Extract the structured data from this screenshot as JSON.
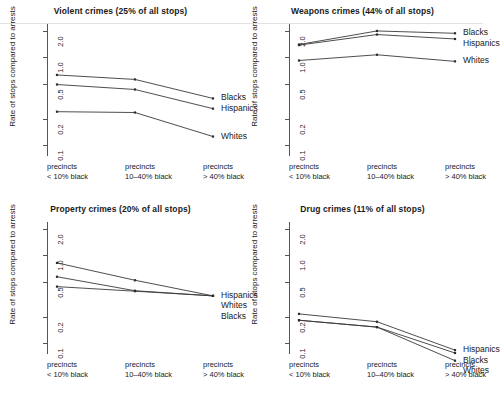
{
  "figure": {
    "ylabel": "Rate of stops compared to arrests",
    "y_ticks": [
      "0.1",
      "0.2",
      "0.5",
      "1.0",
      "2.0"
    ],
    "x_categories": [
      {
        "line1": "precincts",
        "line2": "< 10% black"
      },
      {
        "line1": "precincts",
        "line2": "10–40% black"
      },
      {
        "line1": "precincts",
        "line2": "> 40% black"
      }
    ]
  },
  "chart_data": [
    {
      "type": "line",
      "title": "Violent crimes (25% of all stops)",
      "xlabel": "",
      "ylabel": "Rate of stops compared to arrests",
      "yscale": "log",
      "ylim": [
        0.075,
        2.4
      ],
      "ytick_values": [
        0.1,
        0.2,
        0.5,
        1.0,
        2.0
      ],
      "grid": false,
      "legend_position": "right-inline",
      "categories": [
        "precincts < 10% black",
        "precincts 10–40% black",
        "precincts > 40% black"
      ],
      "series": [
        {
          "name": "Blacks",
          "values": [
            0.63,
            0.56,
            0.34
          ]
        },
        {
          "name": "Hispanics",
          "values": [
            0.49,
            0.43,
            0.26
          ]
        },
        {
          "name": "Whites",
          "values": [
            0.24,
            0.235,
            0.125
          ]
        }
      ]
    },
    {
      "type": "line",
      "title": "Weapons crimes (44% of all stops)",
      "xlabel": "",
      "ylabel": "Rate of stops compared to arrests",
      "yscale": "log",
      "ylim": [
        0.075,
        2.4
      ],
      "ytick_values": [
        0.1,
        0.2,
        0.5,
        1.0,
        2.0
      ],
      "grid": false,
      "legend_position": "right-inline",
      "categories": [
        "precincts < 10% black",
        "precincts 10–40% black",
        "precincts > 40% black"
      ],
      "series": [
        {
          "name": "Blacks",
          "values": [
            1.4,
            2.0,
            1.88
          ]
        },
        {
          "name": "Hispanics",
          "values": [
            1.38,
            1.82,
            1.62
          ]
        },
        {
          "name": "Whites",
          "values": [
            0.92,
            1.07,
            0.9
          ]
        }
      ]
    },
    {
      "type": "line",
      "title": "Property crimes (20% of all stops)",
      "xlabel": "",
      "ylabel": "Rate of stops compared to arrests",
      "yscale": "log",
      "ylim": [
        0.075,
        2.4
      ],
      "ytick_values": [
        0.1,
        0.2,
        0.5,
        1.0,
        2.0
      ],
      "grid": false,
      "legend_position": "right-inline",
      "categories": [
        "precincts < 10% black",
        "precincts 10–40% black",
        "precincts > 40% black"
      ],
      "series": [
        {
          "name": "Hispanics",
          "values": [
            0.82,
            0.52,
            0.345
          ]
        },
        {
          "name": "Whites",
          "values": [
            0.57,
            0.395,
            0.345
          ]
        },
        {
          "name": "Blacks",
          "values": [
            0.44,
            0.39,
            0.345
          ]
        }
      ]
    },
    {
      "type": "line",
      "title": "Drug crimes (11% of all stops)",
      "xlabel": "",
      "ylabel": "Rate of stops compared to arrests",
      "yscale": "log",
      "ylim": [
        0.075,
        2.4
      ],
      "ytick_values": [
        0.1,
        0.2,
        0.5,
        1.0,
        2.0
      ],
      "grid": false,
      "legend_position": "right-inline",
      "categories": [
        "precincts < 10% black",
        "precincts 10–40% black",
        "precincts > 40% black"
      ],
      "series": [
        {
          "name": "Hispanics",
          "values": [
            0.215,
            0.175,
            0.083
          ]
        },
        {
          "name": "Blacks",
          "values": [
            0.182,
            0.152,
            0.077
          ]
        },
        {
          "name": "Whites",
          "values": [
            0.182,
            0.152,
            0.063
          ]
        }
      ]
    }
  ]
}
